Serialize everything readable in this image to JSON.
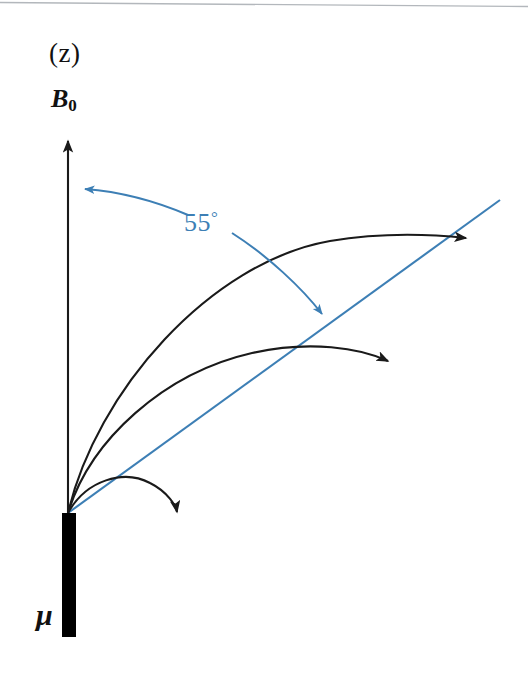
{
  "figure": {
    "width": 528,
    "height": 685,
    "background_color": "#ffffff"
  },
  "colors": {
    "axis": "#1a1a1a",
    "curve": "#1a1a1a",
    "angle_blue": "#3d7fb5",
    "moment_bar": "#000000",
    "page_edge": "#9aa0a6"
  },
  "labels": {
    "axis_parenthetical": "(z)",
    "field_symbol": "B",
    "field_subscript": "0",
    "moment_symbol": "μ",
    "angle_value": "55",
    "angle_degree_sign": "°"
  },
  "geometry": {
    "origin": {
      "x": 68,
      "y": 513
    },
    "b0_axis": {
      "x": 68,
      "y_top": 133,
      "y_bottom": 513
    },
    "magic_angle_line": {
      "x1": 68,
      "y1": 513,
      "x2": 500,
      "y2": 200
    },
    "moment_bar": {
      "x": 62,
      "y_top": 513,
      "y_bottom": 637,
      "width": 14
    },
    "precession_arcs": [
      {
        "name": "outer-arc",
        "end_x": 480,
        "end_y": 239
      },
      {
        "name": "middle-arc",
        "end_x": 400,
        "end_y": 365
      },
      {
        "name": "inner-arc",
        "end_x": 178,
        "end_y": 522
      }
    ],
    "angle_arc": {
      "left_arrow_tip": {
        "x": 73,
        "y": 190
      },
      "right_arrow_tip": {
        "x": 328,
        "y": 322
      }
    }
  }
}
